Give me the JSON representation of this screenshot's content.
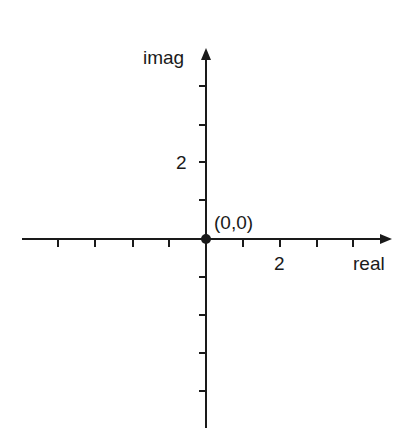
{
  "diagram": {
    "type": "complex-plane",
    "axes": {
      "horizontal_label": "real",
      "vertical_label": "imag"
    },
    "tick_labels": {
      "real_2": "2",
      "imag_2": "2"
    },
    "origin": {
      "label": "(0,0)"
    },
    "ticks": {
      "real": [
        -5,
        -4,
        -3,
        -2,
        1,
        2,
        3,
        4
      ],
      "imag": [
        4,
        3,
        2,
        1,
        -1,
        -2,
        -3,
        -4
      ]
    },
    "colors": {
      "axis": "#1a1a1a",
      "background": "#ffffff"
    }
  }
}
